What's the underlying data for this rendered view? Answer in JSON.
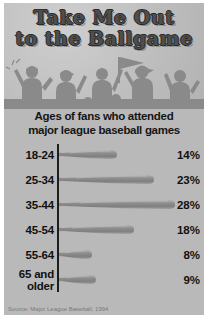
{
  "poster": {
    "title_line1": "Take Me Out",
    "title_line2": "to the Ballgame",
    "subtitle_line1": "Ages of fans who attended",
    "subtitle_line2": "major league baseball games",
    "source": "Source: Major League Baseball, 1994",
    "background_color": "#b9b9b9",
    "title_color": "#4e4e4e",
    "text_color": "#111111",
    "bat_color": "#9a9a9a"
  },
  "chart_data": {
    "type": "bar",
    "title": "Take Me Out to the Ballgame",
    "subtitle": "Ages of fans who attended major league baseball games",
    "orientation": "horizontal",
    "categories": [
      "18-24",
      "25-34",
      "35-44",
      "45-54",
      "55-64",
      "65 and older"
    ],
    "values": [
      14,
      23,
      28,
      18,
      8,
      9
    ],
    "value_labels": [
      "14%",
      "23%",
      "28%",
      "18%",
      "8%",
      "9%"
    ],
    "xlabel": "",
    "ylabel": "",
    "xlim": [
      0,
      28
    ],
    "unit": "%",
    "grid": false,
    "legend": "none",
    "bar_style": "baseball-bat",
    "source": "Source: Major League Baseball, 1994"
  },
  "rows": [
    {
      "label": "18-24",
      "label2": "",
      "pct": "14%",
      "len": 58
    },
    {
      "label": "25-34",
      "label2": "",
      "pct": "23%",
      "len": 95
    },
    {
      "label": "35-44",
      "label2": "",
      "pct": "28%",
      "len": 116
    },
    {
      "label": "45-54",
      "label2": "",
      "pct": "18%",
      "len": 75
    },
    {
      "label": "55-64",
      "label2": "",
      "pct": "8%",
      "len": 33
    },
    {
      "label": "65 and",
      "label2": "older",
      "pct": "9%",
      "len": 37
    }
  ]
}
